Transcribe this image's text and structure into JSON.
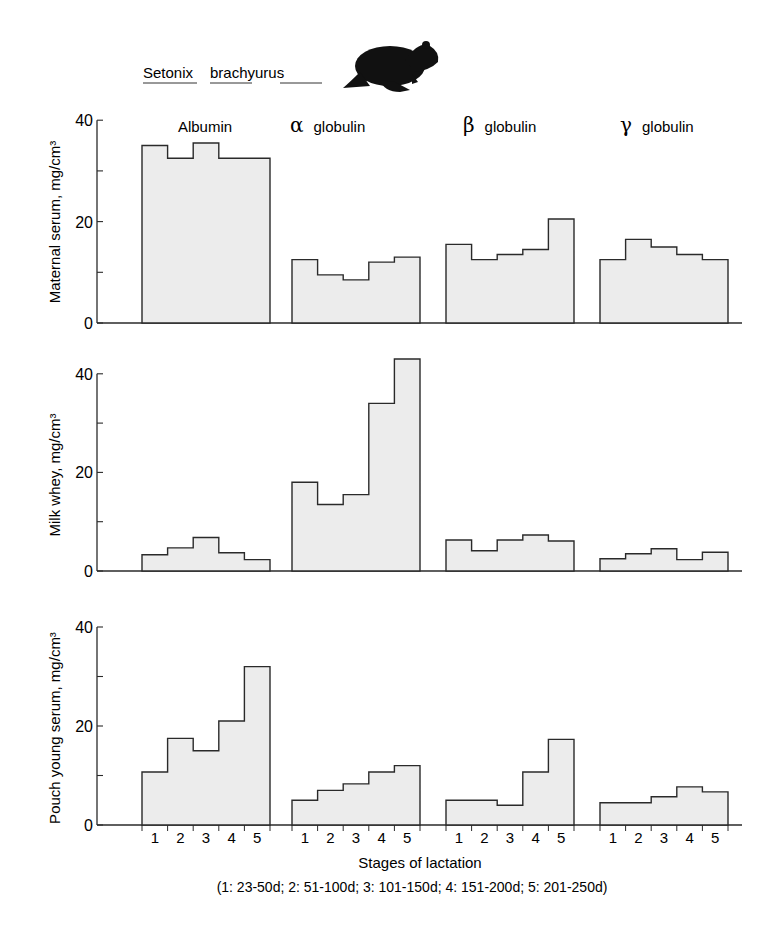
{
  "title": {
    "species_genus": "Setonix",
    "species_epithet": "brachyurus",
    "icon": "quokka-silhouette-icon"
  },
  "xlabel": "Stages of lactation",
  "xlabel_note": "(1: 23-50d;  2: 51-100d;  3: 101-150d;  4: 151-200d;  5: 201-250d)",
  "groups": [
    {
      "symbol": "",
      "label": "Albumin"
    },
    {
      "symbol": "α",
      "label": "globulin"
    },
    {
      "symbol": "β",
      "label": "globulin"
    },
    {
      "symbol": "γ",
      "label": "globulin"
    }
  ],
  "stage_labels": [
    "1",
    "2",
    "3",
    "4",
    "5"
  ],
  "y_ticks": [
    0,
    20,
    40
  ],
  "colors": {
    "bar_fill": "#ececec",
    "stroke": "#2a2a2a"
  },
  "chart_data": [
    {
      "type": "bar",
      "title": "Maternal serum",
      "ylabel": "Maternal serum, mg/cm3",
      "xlabel": "Stages of lactation",
      "ylim": [
        0,
        40
      ],
      "categories": [
        "1",
        "2",
        "3",
        "4",
        "5"
      ],
      "series": [
        {
          "name": "Albumin",
          "values": [
            35,
            32.5,
            35.5,
            32.5,
            32.5
          ]
        },
        {
          "name": "α globulin",
          "values": [
            12.5,
            9.5,
            8.5,
            12,
            13
          ]
        },
        {
          "name": "β globulin",
          "values": [
            15.5,
            12.5,
            13.5,
            14.5,
            20.5
          ]
        },
        {
          "name": "γ globulin",
          "values": [
            12.5,
            16.5,
            15,
            13.5,
            12.5
          ]
        }
      ]
    },
    {
      "type": "bar",
      "title": "Milk whey",
      "ylabel": "Milk whey, mg/cm3",
      "xlabel": "Stages of lactation",
      "ylim": [
        0,
        40
      ],
      "categories": [
        "1",
        "2",
        "3",
        "4",
        "5"
      ],
      "series": [
        {
          "name": "Albumin",
          "values": [
            3.3,
            4.7,
            6.8,
            3.7,
            2.3
          ]
        },
        {
          "name": "α globulin",
          "values": [
            18,
            13.5,
            15.5,
            34,
            43
          ]
        },
        {
          "name": "β globulin",
          "values": [
            6.3,
            4.1,
            6.3,
            7.3,
            6.1
          ]
        },
        {
          "name": "γ globulin",
          "values": [
            2.5,
            3.5,
            4.5,
            2.3,
            3.8
          ]
        }
      ]
    },
    {
      "type": "bar",
      "title": "Pouch young serum",
      "ylabel": "Pouch young serum, mg/cm3",
      "xlabel": "Stages of lactation",
      "ylim": [
        0,
        40
      ],
      "categories": [
        "1",
        "2",
        "3",
        "4",
        "5"
      ],
      "series": [
        {
          "name": "Albumin",
          "values": [
            10.7,
            17.5,
            15,
            21,
            32
          ]
        },
        {
          "name": "α globulin",
          "values": [
            5,
            7,
            8.3,
            10.7,
            12
          ]
        },
        {
          "name": "β globulin",
          "values": [
            5,
            5,
            4,
            10.7,
            17.3
          ]
        },
        {
          "name": "γ globulin",
          "values": [
            4.5,
            4.5,
            5.7,
            7.7,
            6.7
          ]
        }
      ]
    }
  ]
}
